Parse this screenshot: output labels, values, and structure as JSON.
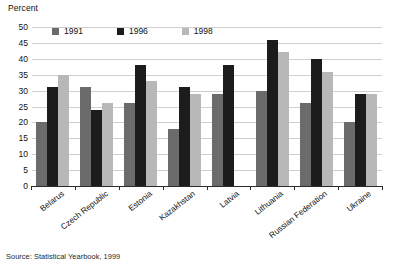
{
  "chart_data": {
    "type": "bar",
    "title": "",
    "ylabel": "Percent",
    "xlabel": "",
    "ylim": [
      0,
      50
    ],
    "yticks": [
      50,
      45,
      40,
      35,
      30,
      25,
      20,
      15,
      10,
      5,
      0
    ],
    "grid": true,
    "legend_position": "top-left-inside",
    "categories": [
      "Belarus",
      "Czech Republic",
      "Estonia",
      "Kazakhstan",
      "Latvia",
      "Lithuania",
      "Russian Federation",
      "Ukraine"
    ],
    "series": [
      {
        "name": "1991",
        "color": "#6b6b6b",
        "values": [
          20,
          31,
          26,
          18,
          29,
          30,
          26,
          20
        ]
      },
      {
        "name": "1996",
        "color": "#1c1c1c",
        "values": [
          31,
          24,
          38,
          31,
          38,
          46,
          40,
          29
        ]
      },
      {
        "name": "1998",
        "color": "#b8b8b8",
        "values": [
          35,
          26,
          33,
          29,
          null,
          42,
          36,
          29
        ]
      }
    ],
    "annotations": {
      "source": "Source: Statistical Yearbook, 1999"
    }
  },
  "axis": {
    "y_title": "Percent"
  },
  "colors": {
    "gridline": "#cfcfcf",
    "baseline": "#2a2a2a",
    "background": "#ffffff",
    "text": "#111111"
  }
}
